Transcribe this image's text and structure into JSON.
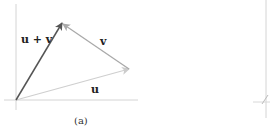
{
  "figure": {
    "panel_a": {
      "caption": "(a)",
      "vectors": [
        {
          "name": "u",
          "label": "u",
          "from": [
            16,
            100
          ],
          "to": [
            129,
            69
          ],
          "color": "#c8c8c8"
        },
        {
          "name": "v",
          "label": "v",
          "from": [
            129,
            69
          ],
          "to": [
            62,
            23
          ],
          "color": "#a8a8a8"
        },
        {
          "name": "u_plus_v",
          "label": "u + v",
          "from": [
            16,
            100
          ],
          "to": [
            62,
            23
          ],
          "color": "#555555"
        }
      ],
      "labels": {
        "u": "u",
        "v": "v",
        "u_plus_v": "u + v"
      },
      "axes": {
        "x_axis_y": 100,
        "y_axis_x": 16,
        "color": "#d0d0d0"
      }
    },
    "panel_b_partial": {
      "axis_color": "#d0d0d0"
    }
  }
}
